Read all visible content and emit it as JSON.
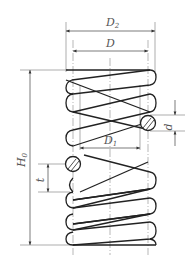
{
  "figure": {
    "colors": {
      "stroke": "#222222",
      "dim": "#555555",
      "center": "#777777"
    },
    "labels": {
      "outer_diameter": {
        "main": "D",
        "sub": "2"
      },
      "mean_diameter": {
        "main": "D",
        "sub": ""
      },
      "inner_diameter": {
        "main": "D",
        "sub": "1"
      },
      "wire_diameter": {
        "main": "d",
        "sub": ""
      },
      "free_height": {
        "main": "H",
        "sub": "0"
      },
      "pitch": {
        "main": "t",
        "sub": ""
      }
    }
  }
}
